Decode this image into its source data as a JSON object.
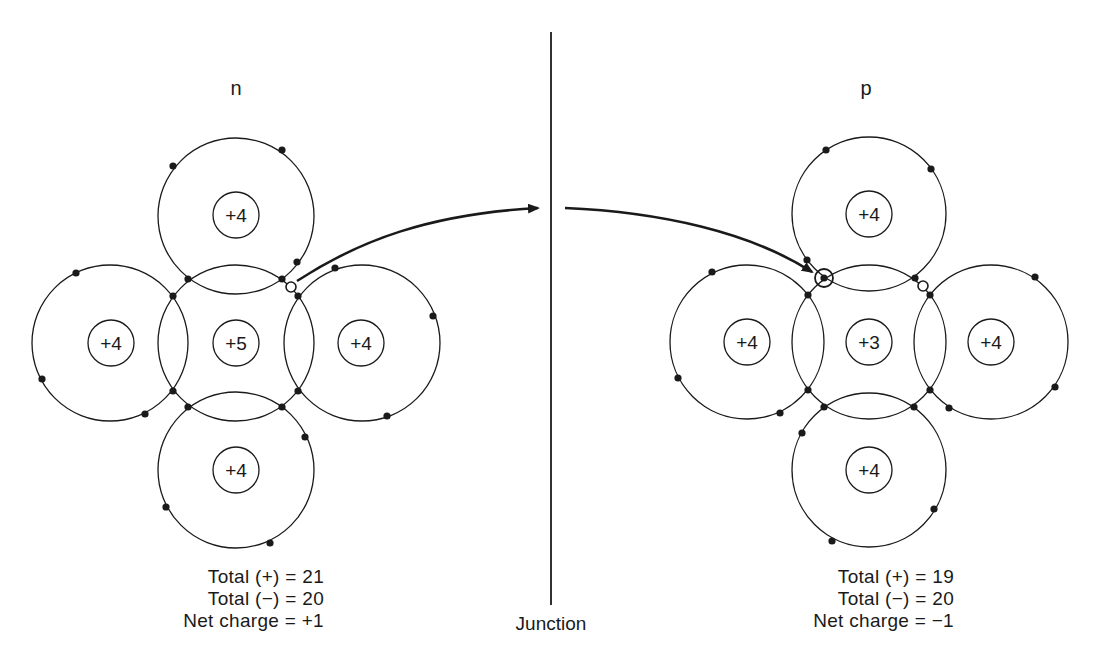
{
  "labels": {
    "n_region": "n",
    "p_region": "p",
    "junction": "Junction"
  },
  "n_side": {
    "nuclei": {
      "top": "+4",
      "left": "+4",
      "center": "+5",
      "right": "+4",
      "bottom": "+4"
    },
    "totals": {
      "positive": "Total (+) = 21",
      "negative": "Total (−) = 20",
      "net": "Net charge = +1"
    }
  },
  "p_side": {
    "nuclei": {
      "top": "+4",
      "left": "+4",
      "center": "+3",
      "right": "+4",
      "bottom": "+4"
    },
    "totals": {
      "positive": "Total (+) = 19",
      "negative": "Total (−) = 20",
      "net": "Net charge = −1"
    }
  },
  "colors": {
    "line": "#1a1a1a",
    "background": "#ffffff"
  }
}
